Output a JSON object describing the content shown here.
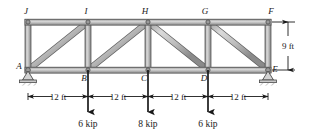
{
  "figure": {
    "colors": {
      "member_fill": "#b9b9b9",
      "member_edge": "#5a5a5a",
      "member_highlight": "#e2e2e2",
      "ink": "#1a1a1a",
      "background": "#ffffff"
    }
  },
  "nodes": [
    {
      "id": "A",
      "label": "A",
      "x": 28,
      "y": 70,
      "label_dx": -9,
      "label_dy": -1
    },
    {
      "id": "B",
      "label": "B",
      "x": 88,
      "y": 70,
      "label_dx": -4,
      "label_dy": 11
    },
    {
      "id": "C",
      "label": "C",
      "x": 148,
      "y": 70,
      "label_dx": -4,
      "label_dy": 11
    },
    {
      "id": "D",
      "label": "D",
      "x": 208,
      "y": 70,
      "label_dx": -4,
      "label_dy": 11
    },
    {
      "id": "E",
      "label": "E",
      "x": 268,
      "y": 70,
      "label_dx": 5,
      "label_dy": 2
    },
    {
      "id": "F",
      "label": "F",
      "x": 268,
      "y": 22,
      "label_dx": 2,
      "label_dy": -4
    },
    {
      "id": "G",
      "label": "G",
      "x": 208,
      "y": 22,
      "label_dx": -4,
      "label_dy": -4
    },
    {
      "id": "H",
      "label": "H",
      "x": 148,
      "y": 22,
      "label_dx": -4,
      "label_dy": -4
    },
    {
      "id": "I",
      "label": "I",
      "x": 88,
      "y": 22,
      "label_dx": -3,
      "label_dy": -4
    },
    {
      "id": "J",
      "label": "J",
      "x": 28,
      "y": 22,
      "label_dx": -3,
      "label_dy": -4
    }
  ],
  "members": {
    "top_chord": [
      [
        "J",
        "I"
      ],
      [
        "I",
        "H"
      ],
      [
        "H",
        "G"
      ],
      [
        "G",
        "F"
      ]
    ],
    "bottom_chord": [
      [
        "A",
        "B"
      ],
      [
        "B",
        "C"
      ],
      [
        "C",
        "D"
      ],
      [
        "D",
        "E"
      ]
    ],
    "verticals": [
      [
        "A",
        "J"
      ],
      [
        "B",
        "I"
      ],
      [
        "C",
        "H"
      ],
      [
        "D",
        "G"
      ],
      [
        "E",
        "F"
      ]
    ],
    "diagonals": [
      [
        "A",
        "I"
      ],
      [
        "B",
        "H"
      ],
      [
        "H",
        "D"
      ],
      [
        "G",
        "E"
      ]
    ]
  },
  "supports": [
    {
      "at": "A",
      "type": "pin",
      "name": "pin-support"
    },
    {
      "at": "E",
      "type": "roller",
      "name": "roller-support"
    }
  ],
  "loads": [
    {
      "at": "B",
      "label": "6 kip",
      "magnitude": 6,
      "unit": "kip",
      "direction": "down"
    },
    {
      "at": "C",
      "label": "8 kip",
      "magnitude": 8,
      "unit": "kip",
      "direction": "down"
    },
    {
      "at": "D",
      "label": "6 kip",
      "magnitude": 6,
      "unit": "kip",
      "direction": "down"
    }
  ],
  "dimensions": {
    "horizontal": [
      {
        "label": "12 ft",
        "from": "A",
        "to": "B"
      },
      {
        "label": "12 ft",
        "from": "B",
        "to": "C"
      },
      {
        "label": "12 ft",
        "from": "C",
        "to": "D"
      },
      {
        "label": "12 ft",
        "from": "D",
        "to": "E"
      }
    ],
    "vertical": [
      {
        "label": "9 ft",
        "from": "F",
        "to": "E"
      }
    ]
  }
}
